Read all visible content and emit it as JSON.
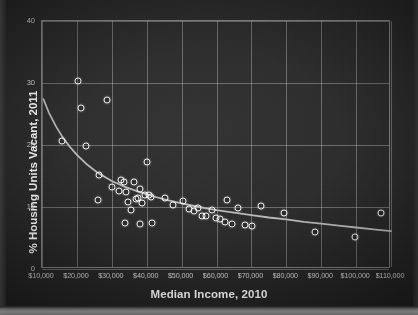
{
  "chart_data": {
    "type": "scatter",
    "title": "",
    "xlabel": "Median Income, 2010",
    "ylabel": "% Housing Units Vacant, 2011",
    "xlim": [
      10000,
      110000
    ],
    "ylim": [
      0,
      40
    ],
    "xticks": [
      10000,
      20000,
      30000,
      40000,
      50000,
      60000,
      70000,
      80000,
      90000,
      100000,
      110000
    ],
    "xticklabels": [
      "$10,000",
      "$20,000",
      "$30,000",
      "$40,000",
      "$50,000",
      "$60,000",
      "$70,000",
      "$80,000",
      "$90,000",
      "$100,000",
      "$110,000"
    ],
    "yticks": [
      0,
      10,
      20,
      30,
      40
    ],
    "yticklabels": [
      "0",
      "10",
      "20",
      "30",
      "40"
    ],
    "grid": true,
    "legend": false,
    "marker": "open-circle",
    "marker_color": "#f2f2f2",
    "background_color": "#2b2b2b",
    "gridline_color": "#c6c6c6",
    "trendline": {
      "type": "power",
      "color": "#b9b9b9",
      "points": [
        [
          10400,
          27.4
        ],
        [
          12000,
          25.2
        ],
        [
          14000,
          23.0
        ],
        [
          16000,
          21.2
        ],
        [
          18000,
          19.7
        ],
        [
          20000,
          18.4
        ],
        [
          23000,
          16.8
        ],
        [
          26000,
          15.5
        ],
        [
          30000,
          14.2
        ],
        [
          34000,
          13.2
        ],
        [
          38000,
          12.4
        ],
        [
          42000,
          11.7
        ],
        [
          46000,
          11.1
        ],
        [
          50000,
          10.6
        ],
        [
          55000,
          10.0
        ],
        [
          60000,
          9.5
        ],
        [
          65000,
          9.1
        ],
        [
          70000,
          8.7
        ],
        [
          75000,
          8.3
        ],
        [
          80000,
          8.0
        ],
        [
          85000,
          7.6
        ],
        [
          90000,
          7.3
        ],
        [
          95000,
          7.0
        ],
        [
          100000,
          6.7
        ],
        [
          105000,
          6.4
        ],
        [
          110000,
          6.1
        ]
      ]
    },
    "points": [
      [
        15800,
        20.7
      ],
      [
        20300,
        30.4
      ],
      [
        21100,
        25.9
      ],
      [
        28600,
        27.2
      ],
      [
        22600,
        19.9
      ],
      [
        26400,
        15.1
      ],
      [
        25900,
        11.2
      ],
      [
        30100,
        13.2
      ],
      [
        32100,
        12.6
      ],
      [
        32700,
        14.4
      ],
      [
        33400,
        14.1
      ],
      [
        34100,
        12.4
      ],
      [
        34600,
        10.8
      ],
      [
        35600,
        9.6
      ],
      [
        36300,
        14.0
      ],
      [
        36900,
        11.3
      ],
      [
        37500,
        11.5
      ],
      [
        38100,
        12.9
      ],
      [
        38700,
        10.6
      ],
      [
        39400,
        12.0
      ],
      [
        40100,
        17.3
      ],
      [
        40600,
        11.9
      ],
      [
        41300,
        11.7
      ],
      [
        33900,
        7.5
      ],
      [
        38200,
        7.3
      ],
      [
        41600,
        7.5
      ],
      [
        45200,
        11.4
      ],
      [
        47600,
        10.3
      ],
      [
        50400,
        11.0
      ],
      [
        52100,
        9.7
      ],
      [
        53400,
        9.4
      ],
      [
        54600,
        9.9
      ],
      [
        55700,
        8.6
      ],
      [
        57100,
        8.5
      ],
      [
        58700,
        9.6
      ],
      [
        59900,
        8.2
      ],
      [
        61100,
        8.0
      ],
      [
        62300,
        7.6
      ],
      [
        63100,
        11.2
      ],
      [
        64400,
        7.2
      ],
      [
        66100,
        9.9
      ],
      [
        68200,
        7.1
      ],
      [
        70300,
        6.9
      ],
      [
        72600,
        10.1
      ],
      [
        79300,
        9.0
      ],
      [
        88200,
        5.9
      ],
      [
        99800,
        5.2
      ],
      [
        107200,
        9.0
      ]
    ]
  },
  "axis": {
    "x_title": "Median Income, 2010",
    "y_title": "% Housing Units Vacant, 2011"
  }
}
